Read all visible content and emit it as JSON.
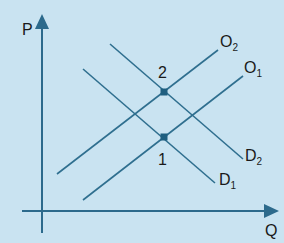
{
  "diagram": {
    "type": "supply-demand",
    "axes": {
      "y_label": "P",
      "x_label": "Q"
    },
    "curves": [
      {
        "id": "O2",
        "name": "O",
        "subscript": "2",
        "kind": "supply"
      },
      {
        "id": "O1",
        "name": "O",
        "subscript": "1",
        "kind": "supply"
      },
      {
        "id": "D2",
        "name": "D",
        "subscript": "2",
        "kind": "demand"
      },
      {
        "id": "D1",
        "name": "D",
        "subscript": "1",
        "kind": "demand"
      }
    ],
    "points": [
      {
        "label": "2",
        "description": "intersection of O2 and D2"
      },
      {
        "label": "1",
        "description": "intersection of O1 and D1"
      }
    ],
    "colors": {
      "background": "#c9e3f1",
      "line": "#2f6f8f",
      "axis": "#2c6a8c",
      "point": "#1f5f80",
      "text": "#1a1a1a"
    }
  }
}
